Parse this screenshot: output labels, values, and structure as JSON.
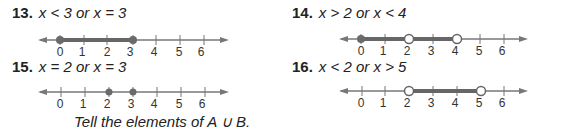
{
  "problems": [
    {
      "number": "13.",
      "expression": "x < 3 or x = 3",
      "line": {
        "ticks": [
          "0",
          "1",
          "2",
          "3",
          "4",
          "5",
          "6"
        ],
        "closed_points": [
          0,
          3
        ],
        "open_points": [],
        "segments": [
          [
            0,
            3
          ]
        ]
      }
    },
    {
      "number": "14.",
      "expression": "x > 2 or x < 4",
      "line": {
        "ticks": [
          "0",
          "1",
          "2",
          "3",
          "4",
          "5",
          "6"
        ],
        "closed_points": [
          0
        ],
        "open_points": [
          2,
          4
        ],
        "segments": [
          [
            0,
            4
          ]
        ]
      }
    },
    {
      "number": "15.",
      "expression": "x = 2 or x = 3",
      "line": {
        "ticks": [
          "0",
          "1",
          "2",
          "3",
          "4",
          "5",
          "6"
        ],
        "closed_points": [
          2,
          3
        ],
        "open_points": [],
        "segments": []
      }
    },
    {
      "number": "16.",
      "expression": "x < 2 or x > 5",
      "line": {
        "ticks": [
          "0",
          "1",
          "2",
          "3",
          "4",
          "5",
          "6"
        ],
        "closed_points": [],
        "open_points": [
          2,
          5
        ],
        "segments": [
          [
            2,
            5
          ]
        ]
      }
    }
  ],
  "caption": "Tell the elements of A ∪ B.",
  "colors": {
    "line": "#777777",
    "highlight": "#666666",
    "point": "#6a6a6a"
  }
}
